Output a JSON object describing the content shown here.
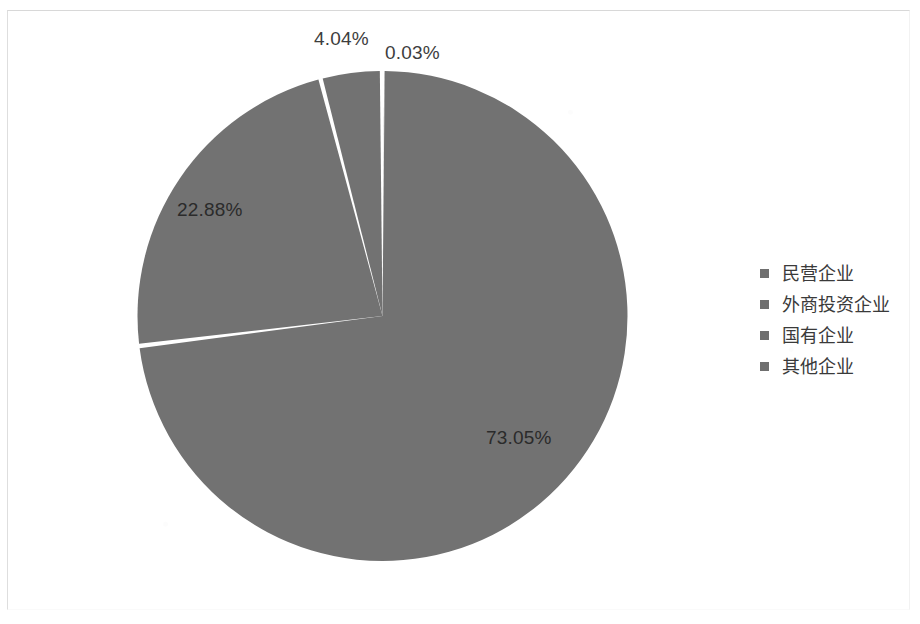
{
  "chart_data": {
    "type": "pie",
    "title": "",
    "subtitle": "",
    "xlabel": "",
    "ylabel": "",
    "grid": false,
    "legend_position": "right",
    "units": "percent",
    "categories": [
      "民营企业",
      "外商投资企业",
      "国有企业",
      "其他企业"
    ],
    "values": [
      73.05,
      22.88,
      4.04,
      0.03
    ],
    "labels": [
      "73.05%",
      "22.88%",
      "4.04%",
      "0.03%"
    ],
    "slice_color": "#727272",
    "separator_color": "#ffffff",
    "start_angle_deg": 0,
    "direction": "clockwise",
    "slices": [
      {
        "name": "民营企业",
        "value": 73.05,
        "label": "73.05%",
        "color": "#727272",
        "start_deg": 0,
        "end_deg": 262.98
      },
      {
        "name": "外商投资企业",
        "value": 22.88,
        "label": "22.88%",
        "color": "#727272",
        "start_deg": 262.98,
        "end_deg": 345.35
      },
      {
        "name": "国有企业",
        "value": 4.04,
        "label": "4.04%",
        "color": "#727272",
        "start_deg": 345.35,
        "end_deg": 359.89
      },
      {
        "name": "其他企业",
        "value": 0.03,
        "label": "0.03%",
        "color": "#727272",
        "start_deg": 359.89,
        "end_deg": 360
      }
    ]
  },
  "pie": {
    "labels": {
      "major": "73.05%",
      "second": "22.88%",
      "third": "4.04%",
      "fourth": "0.03%"
    }
  },
  "legend": {
    "items": [
      {
        "label": "民营企业",
        "color": "#6f6f6f"
      },
      {
        "label": "外商投资企业",
        "color": "#6f6f6f"
      },
      {
        "label": "国有企业",
        "color": "#6f6f6f"
      },
      {
        "label": "其他企业",
        "color": "#6f6f6f"
      }
    ]
  }
}
